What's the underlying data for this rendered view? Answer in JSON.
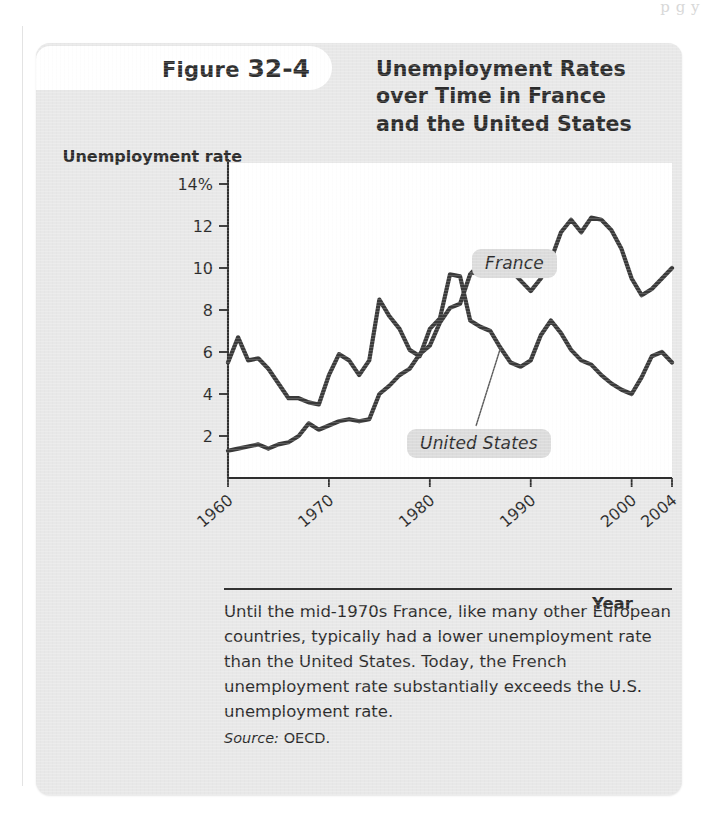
{
  "page": {
    "bleed_text": "p     g     y"
  },
  "figure": {
    "tab_prefix": "Figure",
    "tab_number": "32-4",
    "title_lines": [
      "Unemployment Rates",
      "over Time in France",
      "and the United States"
    ],
    "caption": "Until the mid-1970s France, like many other European countries, typically had a lower unemployment rate than the United States. Today, the French unemployment rate substantially exceeds the U.S. unemployment rate.",
    "source_label": "Source:",
    "source_value": "OECD."
  },
  "chart_data": {
    "type": "line",
    "title": "Unemployment Rates over Time in France and the United States",
    "xlabel": "Year",
    "ylabel": "Unemployment rate",
    "ylim": [
      0,
      15
    ],
    "xlim": [
      1960,
      2004
    ],
    "grid": false,
    "legend": "inline-labels",
    "y_ticks": [
      2,
      4,
      6,
      8,
      10,
      12,
      14
    ],
    "y_tick_labels": [
      "2",
      "4",
      "6",
      "8",
      "10",
      "12",
      "14%"
    ],
    "x_ticks": [
      1960,
      1970,
      1980,
      1990,
      2000,
      2004
    ],
    "x_tick_labels": [
      "1960",
      "1970",
      "1980",
      "1990",
      "2000",
      "2004"
    ],
    "x": [
      1960,
      1961,
      1962,
      1963,
      1964,
      1965,
      1966,
      1967,
      1968,
      1969,
      1970,
      1971,
      1972,
      1973,
      1974,
      1975,
      1976,
      1977,
      1978,
      1979,
      1980,
      1981,
      1982,
      1983,
      1984,
      1985,
      1986,
      1987,
      1988,
      1989,
      1990,
      1991,
      1992,
      1993,
      1994,
      1995,
      1996,
      1997,
      1998,
      1999,
      2000,
      2001,
      2002,
      2003,
      2004
    ],
    "series": [
      {
        "name": "France",
        "label": "France",
        "values": [
          1.3,
          1.4,
          1.5,
          1.6,
          1.4,
          1.6,
          1.7,
          2.0,
          2.6,
          2.3,
          2.5,
          2.7,
          2.8,
          2.7,
          2.8,
          4.0,
          4.4,
          4.9,
          5.2,
          5.9,
          6.3,
          7.4,
          8.1,
          8.3,
          9.7,
          10.2,
          10.4,
          10.5,
          9.9,
          9.4,
          8.9,
          9.5,
          10.4,
          11.7,
          12.3,
          11.7,
          12.4,
          12.3,
          11.8,
          10.9,
          9.5,
          8.7,
          9.0,
          9.5,
          10.0
        ]
      },
      {
        "name": "United States",
        "label": "United States",
        "values": [
          5.5,
          6.7,
          5.6,
          5.7,
          5.2,
          4.5,
          3.8,
          3.8,
          3.6,
          3.5,
          4.9,
          5.9,
          5.6,
          4.9,
          5.6,
          8.5,
          7.7,
          7.1,
          6.1,
          5.8,
          7.1,
          7.6,
          9.7,
          9.6,
          7.5,
          7.2,
          7.0,
          6.2,
          5.5,
          5.3,
          5.6,
          6.8,
          7.5,
          6.9,
          6.1,
          5.6,
          5.4,
          4.9,
          4.5,
          4.2,
          4.0,
          4.8,
          5.8,
          6.0,
          5.5
        ]
      }
    ],
    "annotations": [
      {
        "text": "France",
        "points_to_year": 1984,
        "points_to_value": 9.7
      },
      {
        "text": "United States",
        "points_to_year": 1987,
        "points_to_value": 6.2
      }
    ]
  }
}
